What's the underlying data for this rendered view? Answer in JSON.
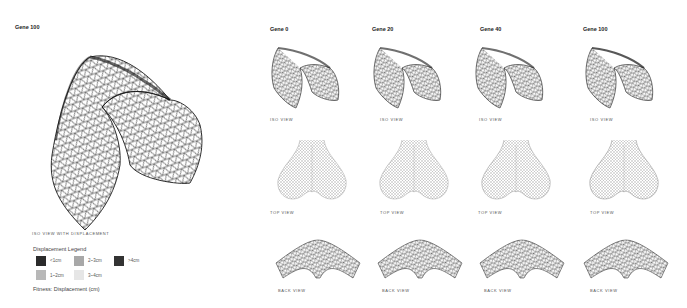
{
  "main_panel": {
    "title": "Gene 100",
    "caption": "ISO VIEW WITH DISPLACEMENT"
  },
  "legend": {
    "title": "Displacement Legend",
    "items": [
      {
        "label": "<1cm",
        "color": "#2b2b2b"
      },
      {
        "label": "2~3cm",
        "color": "#a8a8a8"
      },
      {
        "label": ">4cm",
        "color": "#333333"
      },
      {
        "label": "1~2cm",
        "color": "#b8b8b8"
      },
      {
        "label": "3~4cm",
        "color": "#e6e6e6"
      }
    ],
    "fitness": "Fitness: Displacement (cm)"
  },
  "columns": [
    {
      "title": "Gene 0",
      "iso_caption": "ISO VIEW",
      "top_caption": "TOP VIEW",
      "back_caption": "BACK VIEW"
    },
    {
      "title": "Gene 20",
      "iso_caption": "ISO VIEW",
      "top_caption": "TOP VIEW",
      "back_caption": "BACK VIEW"
    },
    {
      "title": "Gene 40",
      "iso_caption": "ISO VIEW",
      "top_caption": "TOP VIEW",
      "back_caption": "BACK VIEW"
    },
    {
      "title": "Gene 100",
      "iso_caption": "ISO VIEW",
      "top_caption": "TOP VIEW",
      "back_caption": "BACK VIEW"
    }
  ]
}
